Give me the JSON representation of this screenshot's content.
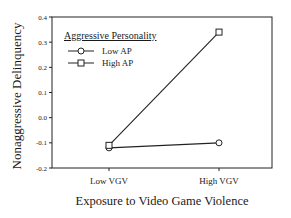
{
  "chart_data": {
    "type": "line",
    "title": "",
    "xlabel": "Exposure to Video Game Violence",
    "ylabel": "Nonaggressive Delinquency",
    "categories": [
      "Low VGV",
      "High VGV"
    ],
    "yticks": [
      "0.4",
      "0.3",
      "0.2",
      "0.1",
      "0.0",
      "-0.1",
      "-0.2"
    ],
    "ylim": [
      -0.2,
      0.4
    ],
    "grid": false,
    "legend": {
      "title": "Aggressive Personality",
      "position": "upper-left",
      "entries": [
        "Low AP",
        "High AP"
      ]
    },
    "series": [
      {
        "name": "Low AP",
        "marker": "circle",
        "values": [
          -0.12,
          -0.1
        ]
      },
      {
        "name": "High AP",
        "marker": "square",
        "values": [
          -0.11,
          0.34
        ]
      }
    ]
  }
}
